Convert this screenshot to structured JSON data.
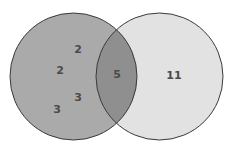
{
  "diagram": {
    "type": "venn",
    "colors": {
      "left_fill": "#aaaaaa",
      "right_fill": "#e2e2e2",
      "overlap_fill": "#8f8f8f",
      "stroke": "#3a3a3a",
      "text": "#4a4a4a"
    },
    "left_only_values": [
      "2",
      "2",
      "3",
      "3"
    ],
    "intersection_value": "5",
    "right_only_value": "11"
  }
}
